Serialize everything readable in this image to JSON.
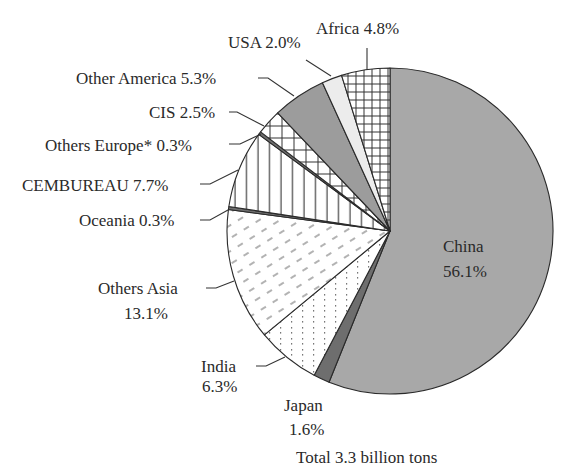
{
  "chart_data": {
    "type": "pie",
    "title": "",
    "footnote": "Total 3.3 billion tons",
    "start_angle_deg": 0,
    "direction": "clockwise",
    "unit": "%",
    "slices": [
      {
        "name": "China",
        "value": 56.1,
        "label": "China",
        "pct": "56.1%",
        "fill": "gray",
        "color": "#a8a8a8"
      },
      {
        "name": "Japan",
        "value": 1.6,
        "label": "Japan",
        "pct": "1.6%",
        "fill": "darkgray",
        "color": "#6e6e6e"
      },
      {
        "name": "India",
        "value": 6.3,
        "label": "India",
        "pct": "6.3%",
        "fill": "dots",
        "color": "#ffffff"
      },
      {
        "name": "Others Asia",
        "value": 13.1,
        "label": "Others Asia",
        "pct": "13.1%",
        "fill": "dashes",
        "color": "#ffffff"
      },
      {
        "name": "Oceania",
        "value": 0.3,
        "label": "Oceania 0.3%",
        "pct": "0.3%",
        "fill": "darkgray",
        "color": "#6e6e6e"
      },
      {
        "name": "CEMBUREAU",
        "value": 7.7,
        "label": "CEMBUREAU 7.7%",
        "pct": "7.7%",
        "fill": "vlines",
        "color": "#ffffff"
      },
      {
        "name": "Others Europe*",
        "value": 0.3,
        "label": "Others Europe* 0.3%",
        "pct": "0.3%",
        "fill": "darkgray",
        "color": "#6e6e6e"
      },
      {
        "name": "CIS",
        "value": 2.5,
        "label": "CIS 2.5%",
        "pct": "2.5%",
        "fill": "grid-large",
        "color": "#ffffff"
      },
      {
        "name": "Other America",
        "value": 5.3,
        "label": "Other America 5.3%",
        "pct": "5.3%",
        "fill": "gray",
        "color": "#9c9c9c"
      },
      {
        "name": "USA",
        "value": 2.0,
        "label": "USA 2.0%",
        "pct": "2.0%",
        "fill": "lightgray",
        "color": "#ececec"
      },
      {
        "name": "Africa",
        "value": 4.8,
        "label": "Africa 4.8%",
        "pct": "4.8%",
        "fill": "grid-small",
        "color": "#ffffff"
      }
    ],
    "total_label": "Total 3.3 billion tons",
    "legend": "none (direct labels with leader lines)"
  },
  "labels": {
    "china_name": "China",
    "china_pct": "56.1%",
    "japan_name": "Japan",
    "japan_pct": "1.6%",
    "india_name": "India",
    "india_pct": "6.3%",
    "others_asia_name": "Others Asia",
    "others_asia_pct": "13.1%",
    "oceania": "Oceania 0.3%",
    "cembureau": "CEMBUREAU 7.7%",
    "others_europe": "Others Europe* 0.3%",
    "cis": "CIS 2.5%",
    "other_america": "Other America 5.3%",
    "usa": "USA 2.0%",
    "africa": "Africa 4.8%",
    "total": "Total 3.3 billion tons"
  }
}
